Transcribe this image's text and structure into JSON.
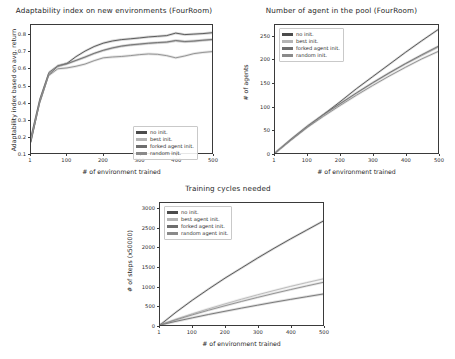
{
  "figure": {
    "background_color": "#ffffff",
    "text_color": "#262626"
  },
  "charts": [
    {
      "id": "adaptability-index",
      "title": "Adaptability index on new environments (FourRoom)",
      "type": "line",
      "xlabel": "# of environment trained",
      "ylabel": "Adaptability index based on avg. return",
      "xlim": [
        1,
        500
      ],
      "ylim": [
        0.1,
        0.86
      ],
      "xticks": [
        "1",
        "100",
        "200",
        "300",
        "400",
        "500"
      ],
      "xtick_values": [
        1,
        100,
        200,
        300,
        400,
        500
      ],
      "yticks": [
        "0.1",
        "0.2",
        "0.3",
        "0.4",
        "0.5",
        "0.6",
        "0.7",
        "0.8"
      ],
      "ytick_values": [
        0.1,
        0.2,
        0.3,
        0.4,
        0.5,
        0.6,
        0.7,
        0.8
      ],
      "grid": false,
      "legend_position": "lower right",
      "x": [
        1,
        25,
        50,
        75,
        100,
        125,
        150,
        175,
        200,
        225,
        250,
        275,
        300,
        325,
        350,
        375,
        400,
        425,
        450,
        475,
        500
      ],
      "series": [
        {
          "name": "no init.",
          "color": "#4c4c4c",
          "values": [
            0.165,
            0.4,
            0.565,
            0.615,
            0.632,
            0.672,
            0.705,
            0.732,
            0.752,
            0.765,
            0.773,
            0.778,
            0.783,
            0.789,
            0.793,
            0.797,
            0.812,
            0.803,
            0.806,
            0.809,
            0.814
          ]
        },
        {
          "name": "best init.",
          "color": "#b4b4b4",
          "values": [
            0.19,
            0.415,
            0.575,
            0.617,
            0.628,
            0.648,
            0.668,
            0.69,
            0.708,
            0.722,
            0.733,
            0.74,
            0.745,
            0.75,
            0.754,
            0.757,
            0.766,
            0.76,
            0.763,
            0.768,
            0.772
          ]
        },
        {
          "name": "forked agent init.",
          "color": "#6e6e6e",
          "values": [
            0.2,
            0.42,
            0.578,
            0.618,
            0.63,
            0.65,
            0.67,
            0.692,
            0.71,
            0.724,
            0.735,
            0.742,
            0.747,
            0.752,
            0.756,
            0.759,
            0.768,
            0.762,
            0.765,
            0.77,
            0.774
          ]
        },
        {
          "name": "random init.",
          "color": "#8a8a8a",
          "values": [
            0.175,
            0.395,
            0.56,
            0.6,
            0.605,
            0.615,
            0.628,
            0.648,
            0.665,
            0.67,
            0.673,
            0.678,
            0.684,
            0.688,
            0.686,
            0.678,
            0.665,
            0.676,
            0.69,
            0.697,
            0.702
          ]
        }
      ]
    },
    {
      "id": "agents-in-pool",
      "title": "Number of agent in the pool (FourRoom)",
      "type": "line",
      "xlabel": "# of environment trained",
      "ylabel": "# of agents",
      "xlim": [
        1,
        500
      ],
      "ylim": [
        0,
        275
      ],
      "xticks": [
        "1",
        "100",
        "200",
        "300",
        "400",
        "500"
      ],
      "xtick_values": [
        1,
        100,
        200,
        300,
        400,
        500
      ],
      "yticks": [
        "0",
        "50",
        "100",
        "150",
        "200",
        "250"
      ],
      "ytick_values": [
        0,
        50,
        100,
        150,
        200,
        250
      ],
      "grid": false,
      "legend_position": "upper left",
      "x": [
        1,
        50,
        100,
        150,
        200,
        250,
        300,
        350,
        400,
        450,
        500
      ],
      "series": [
        {
          "name": "no init.",
          "color": "#4c4c4c",
          "values": [
            0,
            28,
            56,
            83,
            110,
            138,
            164,
            190,
            216,
            241,
            265
          ]
        },
        {
          "name": "best init.",
          "color": "#b4b4b4",
          "values": [
            0,
            29,
            57,
            82,
            105,
            128,
            150,
            171,
            191,
            209,
            227
          ]
        },
        {
          "name": "forked agent init.",
          "color": "#6e6e6e",
          "values": [
            0,
            30,
            58,
            83,
            106,
            129,
            151,
            172,
            192,
            211,
            229
          ]
        },
        {
          "name": "random init.",
          "color": "#8a8a8a",
          "values": [
            0,
            28,
            55,
            79,
            102,
            124,
            145,
            165,
            184,
            202,
            218
          ]
        }
      ]
    },
    {
      "id": "training-cycles",
      "title": "Training cycles needed",
      "type": "line",
      "xlabel": "# of environment trained",
      "ylabel": "# of steps (x50000)",
      "xlim": [
        1,
        500
      ],
      "ylim": [
        0,
        3150
      ],
      "xticks": [
        "1",
        "100",
        "200",
        "300",
        "400",
        "500"
      ],
      "xtick_values": [
        1,
        100,
        200,
        300,
        400,
        500
      ],
      "yticks": [
        "0",
        "500",
        "1000",
        "1500",
        "2000",
        "2500",
        "3000"
      ],
      "ytick_values": [
        0,
        500,
        1000,
        1500,
        2000,
        2500,
        3000
      ],
      "grid": false,
      "legend_position": "upper left",
      "x": [
        1,
        50,
        100,
        150,
        200,
        250,
        300,
        350,
        400,
        450,
        500
      ],
      "series": [
        {
          "name": "no init.",
          "color": "#4c4c4c",
          "values": [
            0,
            330,
            640,
            930,
            1210,
            1470,
            1730,
            1980,
            2220,
            2450,
            2680
          ]
        },
        {
          "name": "best agent init.",
          "color": "#b4b4b4",
          "values": [
            0,
            150,
            290,
            420,
            545,
            665,
            780,
            890,
            995,
            1095,
            1190
          ]
        },
        {
          "name": "forked agent init.",
          "color": "#6e6e6e",
          "values": [
            0,
            95,
            185,
            272,
            355,
            435,
            512,
            588,
            660,
            730,
            800
          ]
        },
        {
          "name": "random agent init.",
          "color": "#8a8a8a",
          "values": [
            0,
            135,
            262,
            382,
            497,
            607,
            713,
            815,
            913,
            1008,
            1100
          ]
        }
      ]
    }
  ]
}
